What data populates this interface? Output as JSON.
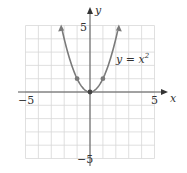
{
  "chart_data": {
    "type": "line",
    "title": "",
    "xlabel": "x",
    "ylabel": "y",
    "xlim": [
      -5,
      5
    ],
    "ylim": [
      -5,
      5
    ],
    "grid": true,
    "x_tick_labels": [
      "-5",
      "5"
    ],
    "y_tick_labels": [
      "5",
      "-5"
    ],
    "series": [
      {
        "name": "y = x^2",
        "label": "y = x",
        "label_exponent": "2",
        "equation": "y = x^2",
        "x": [
          -2.236,
          -2,
          -1.5,
          -1,
          -0.5,
          0,
          0.5,
          1,
          1.5,
          2,
          2.236
        ],
        "y": [
          5,
          4,
          2.25,
          1,
          0.25,
          0,
          0.25,
          1,
          2.25,
          4,
          5
        ],
        "marked_points": [
          [
            -1,
            1
          ],
          [
            0,
            0
          ],
          [
            1,
            1
          ]
        ],
        "color": "#7a7a7a"
      }
    ]
  },
  "labels": {
    "x_axis": "x",
    "y_axis": "y",
    "x_min": "−5",
    "x_max": "5",
    "y_max": "5",
    "y_min": "−5",
    "curve_label": "y = x",
    "curve_exp": "2"
  },
  "colors": {
    "grid": "#d8d8d8",
    "axis": "#555555",
    "curve": "#7a7a7a"
  }
}
